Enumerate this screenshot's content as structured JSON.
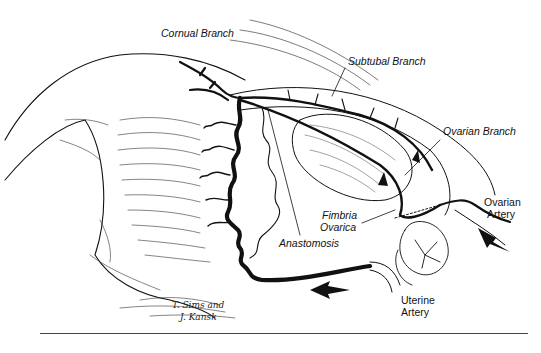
{
  "figure": {
    "labels": {
      "cornual_branch": "Cornual Branch",
      "subtubal_branch": "Subtubal Branch",
      "ovarian_branch": "Ovarian Branch",
      "ovarian_artery_line1": "Ovarian",
      "ovarian_artery_line2": "Artery",
      "fimbria_line1": "Fimbria",
      "fimbria_line2": "Ovarica",
      "anastomosis": "Anastomosis",
      "uterine_artery_line1": "Uterine",
      "uterine_artery_line2": "Artery"
    },
    "signature_line1": "T. Sims and",
    "signature_line2": "J. Kansk",
    "colors": {
      "ink": "#111111",
      "paper": "#ffffff"
    }
  }
}
